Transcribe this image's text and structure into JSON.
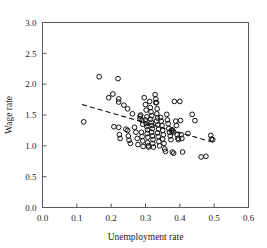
{
  "chart_data": {
    "type": "scatter",
    "title": "",
    "xlabel": "Unemployment rate",
    "ylabel": "Wage rate",
    "xlim": [
      0.0,
      0.6
    ],
    "ylim": [
      0.0,
      3.0
    ],
    "xticks": [
      "0.0",
      "0.1",
      "0.2",
      "0.3",
      "0.4",
      "0.5",
      "0.6"
    ],
    "xtick_values": [
      0.0,
      0.1,
      0.2,
      0.3,
      0.4,
      0.5,
      0.6
    ],
    "yticks": [
      "0.0",
      "0.5",
      "1.0",
      "1.5",
      "2.0",
      "2.5",
      "3.0"
    ],
    "ytick_values": [
      0.0,
      0.5,
      1.0,
      1.5,
      2.0,
      2.5,
      3.0
    ],
    "grid": false,
    "legend": false,
    "marker": "open-circle",
    "marker_color": "#111111",
    "series": [
      {
        "name": "observations",
        "points": [
          [
            0.12,
            1.39
          ],
          [
            0.165,
            2.12
          ],
          [
            0.22,
            2.09
          ],
          [
            0.193,
            1.78
          ],
          [
            0.205,
            1.84
          ],
          [
            0.222,
            1.76
          ],
          [
            0.222,
            1.71
          ],
          [
            0.237,
            1.66
          ],
          [
            0.248,
            1.6
          ],
          [
            0.262,
            1.52
          ],
          [
            0.208,
            1.31
          ],
          [
            0.222,
            1.3
          ],
          [
            0.224,
            1.18
          ],
          [
            0.226,
            1.12
          ],
          [
            0.243,
            1.27
          ],
          [
            0.248,
            1.25
          ],
          [
            0.25,
            1.16
          ],
          [
            0.252,
            1.09
          ],
          [
            0.256,
            1.04
          ],
          [
            0.268,
            1.3
          ],
          [
            0.272,
            1.22
          ],
          [
            0.276,
            1.12
          ],
          [
            0.278,
            1.02
          ],
          [
            0.284,
            1.48
          ],
          [
            0.284,
            1.44
          ],
          [
            0.286,
            1.5
          ],
          [
            0.29,
            1.41
          ],
          [
            0.292,
            1.35
          ],
          [
            0.288,
            1.22
          ],
          [
            0.29,
            1.15
          ],
          [
            0.292,
            1.08
          ],
          [
            0.293,
            0.99
          ],
          [
            0.296,
            1.78
          ],
          [
            0.3,
            1.67
          ],
          [
            0.302,
            1.58
          ],
          [
            0.304,
            1.47
          ],
          [
            0.3,
            1.42
          ],
          [
            0.302,
            1.36
          ],
          [
            0.304,
            1.31
          ],
          [
            0.306,
            1.26
          ],
          [
            0.305,
            1.2
          ],
          [
            0.307,
            1.14
          ],
          [
            0.306,
            1.05
          ],
          [
            0.308,
            1.0
          ],
          [
            0.309,
            0.98
          ],
          [
            0.312,
            1.72
          ],
          [
            0.314,
            1.62
          ],
          [
            0.316,
            1.55
          ],
          [
            0.318,
            1.49
          ],
          [
            0.315,
            1.43
          ],
          [
            0.317,
            1.38
          ],
          [
            0.319,
            1.33
          ],
          [
            0.32,
            1.28
          ],
          [
            0.318,
            1.22
          ],
          [
            0.32,
            1.16
          ],
          [
            0.322,
            1.1
          ],
          [
            0.321,
            1.04
          ],
          [
            0.323,
            0.98
          ],
          [
            0.328,
            1.83
          ],
          [
            0.33,
            1.76
          ],
          [
            0.332,
            1.7
          ],
          [
            0.33,
            1.7
          ],
          [
            0.334,
            1.6
          ],
          [
            0.333,
            1.52
          ],
          [
            0.335,
            1.45
          ],
          [
            0.332,
            1.4
          ],
          [
            0.336,
            1.34
          ],
          [
            0.338,
            1.27
          ],
          [
            0.335,
            1.21
          ],
          [
            0.337,
            1.15
          ],
          [
            0.339,
            1.07
          ],
          [
            0.341,
            1.0
          ],
          [
            0.344,
            1.46
          ],
          [
            0.346,
            1.4
          ],
          [
            0.348,
            1.33
          ],
          [
            0.35,
            1.25
          ],
          [
            0.352,
            1.18
          ],
          [
            0.35,
            1.11
          ],
          [
            0.354,
            1.04
          ],
          [
            0.356,
            0.95
          ],
          [
            0.358,
            0.91
          ],
          [
            0.362,
            1.51
          ],
          [
            0.364,
            1.42
          ],
          [
            0.366,
            1.36
          ],
          [
            0.368,
            1.28
          ],
          [
            0.37,
            1.22
          ],
          [
            0.372,
            1.16
          ],
          [
            0.374,
            1.1
          ],
          [
            0.376,
            1.25
          ],
          [
            0.378,
            1.26
          ],
          [
            0.38,
            1.24
          ],
          [
            0.382,
            1.22
          ],
          [
            0.378,
            0.9
          ],
          [
            0.382,
            0.88
          ],
          [
            0.384,
            1.72
          ],
          [
            0.388,
            1.4
          ],
          [
            0.39,
            1.33
          ],
          [
            0.392,
            1.18
          ],
          [
            0.394,
            1.12
          ],
          [
            0.396,
            1.1
          ],
          [
            0.4,
            1.72
          ],
          [
            0.402,
            1.41
          ],
          [
            0.404,
            1.18
          ],
          [
            0.406,
            1.12
          ],
          [
            0.408,
            0.9
          ],
          [
            0.424,
            1.2
          ],
          [
            0.436,
            1.51
          ],
          [
            0.444,
            1.41
          ],
          [
            0.462,
            0.82
          ],
          [
            0.476,
            0.83
          ],
          [
            0.49,
            1.17
          ],
          [
            0.492,
            1.11
          ],
          [
            0.496,
            1.1
          ]
        ]
      }
    ],
    "trendline": {
      "style": "dashed",
      "color": "#111111",
      "x_start": 0.115,
      "y_start": 1.67,
      "x_end": 0.502,
      "y_end": 1.05
    }
  }
}
